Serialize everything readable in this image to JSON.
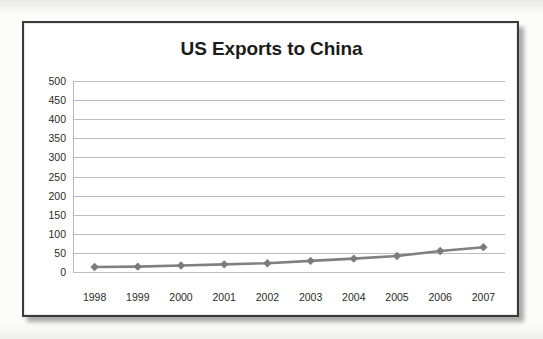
{
  "document": {
    "frame_border_color": "#3a3a3a",
    "page_background": "#fcfcfb"
  },
  "chart_data": {
    "type": "line",
    "title": "US Exports to China",
    "xlabel": "",
    "ylabel": "",
    "categories": [
      "1998",
      "1999",
      "2000",
      "2001",
      "2002",
      "2003",
      "2004",
      "2005",
      "2006",
      "2007"
    ],
    "values": [
      13,
      14,
      17,
      20,
      23,
      29,
      35,
      42,
      55,
      65
    ],
    "series": [
      {
        "name": "US Exports to China",
        "values": [
          13,
          14,
          17,
          20,
          23,
          29,
          35,
          42,
          55,
          65
        ]
      }
    ],
    "ylim": [
      0,
      500
    ],
    "ytick_labels": [
      "500",
      "450",
      "400",
      "350",
      "300",
      "250",
      "200",
      "150",
      "100",
      "50",
      "0"
    ],
    "ytick_values": [
      500,
      450,
      400,
      350,
      300,
      250,
      200,
      150,
      100,
      50,
      0
    ],
    "ytick_step": 50,
    "grid": true,
    "grid_axis": "y",
    "legend": false,
    "legend_position": "none",
    "marker": "diamond",
    "line_color": "#808080",
    "marker_color": "#7b7b7b",
    "grid_color": "#bdbdbd",
    "title_color": "#1c1c1c",
    "plot_background": "#ffffff"
  }
}
